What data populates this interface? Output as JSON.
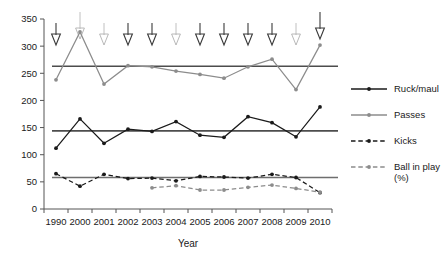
{
  "chart_data": {
    "type": "line",
    "title": "",
    "xlabel": "Year",
    "ylabel": "",
    "ylim": [
      0,
      350
    ],
    "yticks": [
      0,
      50,
      100,
      150,
      200,
      250,
      300,
      350
    ],
    "ytick_labels": [
      "0",
      "50",
      "100",
      "150",
      "200",
      "250",
      "300",
      "350"
    ],
    "grid": false,
    "legend_position": "right",
    "categories": [
      "1990",
      "2000",
      "2001",
      "2002",
      "2003",
      "2004",
      "2005",
      "2006",
      "2007",
      "2008",
      "2009",
      "2010"
    ],
    "series": [
      {
        "name": "Ruck/maul",
        "color": "#1a1a1a",
        "style": "solid",
        "marker": "filled-circle",
        "values": [
          112,
          166,
          121,
          147,
          143,
          161,
          136,
          132,
          170,
          159,
          133,
          188
        ]
      },
      {
        "name": "Passes",
        "color": "#8c8c8c",
        "style": "solid",
        "marker": "filled-circle",
        "values": [
          238,
          326,
          230,
          264,
          262,
          254,
          248,
          241,
          262,
          276,
          220,
          302
        ]
      },
      {
        "name": "Kicks",
        "color": "#1a1a1a",
        "style": "dashed",
        "marker": "filled-circle",
        "values": [
          65,
          42,
          64,
          56,
          57,
          52,
          60,
          59,
          57,
          64,
          58,
          30
        ]
      },
      {
        "name": "Ball in play (%)",
        "color": "#8c8c8c",
        "style": "dashed",
        "marker": "filled-circle",
        "values": [
          null,
          null,
          null,
          null,
          39,
          43,
          35,
          35,
          40,
          44,
          38,
          31
        ]
      }
    ],
    "mean_lines": [
      {
        "series": "Passes",
        "value": 263,
        "color": "#4d4d4d"
      },
      {
        "series": "Ruck/maul",
        "value": 144,
        "color": "#4d4d4d"
      },
      {
        "series": "Kicks",
        "value": 58,
        "color": "#6e6e6e"
      }
    ],
    "annotations": {
      "description": "Downward arrows above the plot, one per year category, marking law changes",
      "marker": "down-arrow",
      "arrows": [
        {
          "category": "1990",
          "shade": "dark"
        },
        {
          "category": "2000",
          "shade": "light"
        },
        {
          "category": "2001",
          "shade": "light"
        },
        {
          "category": "2002",
          "shade": "dark"
        },
        {
          "category": "2003",
          "shade": "dark"
        },
        {
          "category": "2004",
          "shade": "light"
        },
        {
          "category": "2005",
          "shade": "dark"
        },
        {
          "category": "2006",
          "shade": "dark"
        },
        {
          "category": "2007",
          "shade": "dark"
        },
        {
          "category": "2008",
          "shade": "dark"
        },
        {
          "category": "2009",
          "shade": "light"
        },
        {
          "category": "2010",
          "shade": "dark"
        }
      ]
    },
    "legend": [
      {
        "label": "Ruck/maul",
        "color": "#1a1a1a",
        "style": "solid"
      },
      {
        "label": "Passes",
        "color": "#8c8c8c",
        "style": "solid"
      },
      {
        "label": "Kicks",
        "color": "#1a1a1a",
        "style": "dashed"
      },
      {
        "label": "Ball in play",
        "label2": "(%)",
        "color": "#8c8c8c",
        "style": "dashed"
      }
    ]
  }
}
